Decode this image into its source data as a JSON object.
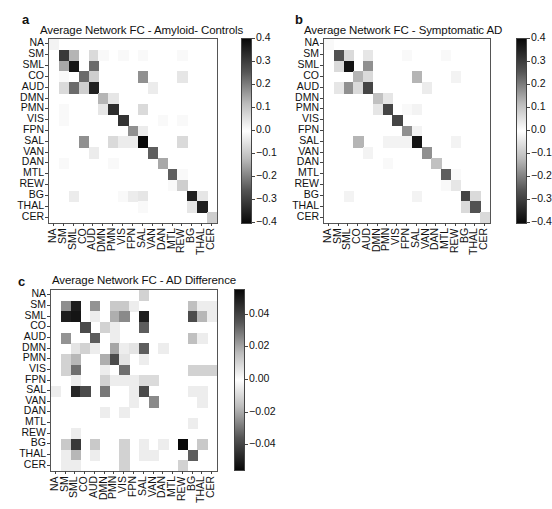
{
  "panels": [
    {
      "letter": "a",
      "title": "Average Network FC - Amyloid- Controls"
    },
    {
      "letter": "b",
      "title": "Average Network FC - Symptomatic AD"
    },
    {
      "letter": "c",
      "title": "Average Network FC - AD Difference"
    }
  ],
  "chart_data": [
    {
      "type": "heatmap",
      "title": "Average Network FC - Amyloid- Controls",
      "panel": "a",
      "rows": [
        "NA",
        "SM",
        "SML",
        "CO",
        "AUD",
        "DMN",
        "PMN",
        "VIS",
        "FPN",
        "SAL",
        "VAN",
        "DAN",
        "MTL",
        "REW",
        "BG",
        "THAL",
        "CER"
      ],
      "cols": [
        "NA",
        "SM",
        "SML",
        "CO",
        "AUD",
        "DMN",
        "PMN",
        "VIS",
        "FPN",
        "SAL",
        "VAN",
        "DAN",
        "MTL",
        "REW",
        "BG",
        "THAL",
        "CER"
      ],
      "colorbar": {
        "min": -0.4,
        "max": 0.4,
        "ticks": [
          "0.4",
          "0.3",
          "0.2",
          "0.1",
          "0.0",
          "−0.1",
          "−0.2",
          "−0.3",
          "−0.4"
        ],
        "colormap": "gray (black=|high|, white=0)"
      },
      "grid": false,
      "values": [
        [
          0.02,
          0,
          0,
          0,
          0,
          0,
          0,
          0,
          0,
          0,
          0,
          0,
          0,
          0,
          0,
          0,
          0
        ],
        [
          0,
          0.32,
          0.12,
          0,
          0.06,
          0.01,
          0,
          0.01,
          0,
          0.01,
          0,
          0,
          0,
          0.01,
          0,
          0,
          0
        ],
        [
          0,
          0.14,
          0.38,
          0,
          0.24,
          0,
          0,
          0,
          0,
          0,
          0,
          0,
          0,
          0,
          0,
          0,
          0
        ],
        [
          0,
          0.01,
          0,
          0.24,
          0.08,
          0,
          0,
          0,
          0,
          0.18,
          0,
          0,
          0,
          0.04,
          0,
          0,
          0
        ],
        [
          0,
          0.06,
          0.24,
          0.08,
          0.36,
          0,
          0,
          0,
          0,
          0,
          0.03,
          0,
          0,
          0,
          0,
          0,
          0
        ],
        [
          0,
          0,
          0,
          0,
          0,
          0.12,
          0.04,
          0,
          0,
          0,
          0,
          0,
          0,
          0,
          0,
          0,
          0
        ],
        [
          0,
          0.01,
          0,
          0,
          0,
          0.04,
          0.34,
          0,
          0,
          0.06,
          0,
          0,
          0,
          0,
          0,
          0,
          0
        ],
        [
          0,
          0.01,
          0,
          0,
          0,
          0,
          0,
          0.33,
          0,
          0,
          0,
          0.01,
          0,
          0.01,
          0,
          0,
          0
        ],
        [
          0,
          0,
          0,
          0,
          0,
          0,
          0,
          0,
          0.18,
          0.03,
          0,
          0,
          0,
          0,
          0,
          0,
          0
        ],
        [
          0,
          0,
          0,
          0.18,
          0,
          0,
          0.06,
          0.03,
          0.03,
          0.4,
          0,
          0,
          0,
          0.06,
          0,
          0,
          0
        ],
        [
          0,
          0,
          0,
          0,
          0.03,
          0,
          0,
          0,
          0,
          0,
          0.26,
          0,
          0,
          0,
          0,
          0,
          0
        ],
        [
          0,
          0.01,
          0,
          0,
          0,
          0,
          0.01,
          0,
          0,
          0,
          0,
          0.14,
          0,
          0,
          0,
          0,
          0
        ],
        [
          0,
          0,
          0,
          0,
          0,
          0,
          0,
          0,
          0,
          0,
          0,
          0,
          0.26,
          0.01,
          0,
          0,
          0
        ],
        [
          0,
          0,
          0,
          0,
          0,
          0,
          0,
          0,
          0,
          0,
          0,
          0,
          0.01,
          0.08,
          0,
          0,
          0
        ],
        [
          0,
          0,
          0.03,
          0,
          0,
          0,
          0,
          0.01,
          0.03,
          0.04,
          0,
          0,
          0,
          0,
          0.36,
          0.04,
          0
        ],
        [
          0,
          0,
          0,
          0,
          0,
          0,
          0,
          0,
          0,
          0.01,
          0,
          0,
          0,
          0,
          0.04,
          0.36,
          0
        ],
        [
          0,
          0,
          0,
          0,
          0,
          0,
          0,
          0,
          0,
          0,
          0,
          0,
          0,
          0,
          0,
          0,
          0.08
        ]
      ]
    },
    {
      "type": "heatmap",
      "title": "Average Network FC - Symptomatic AD",
      "panel": "b",
      "rows": [
        "NA",
        "SM",
        "SML",
        "CO",
        "AUD",
        "DMN",
        "PMN",
        "VIS",
        "FPN",
        "SAL",
        "VAN",
        "DAN",
        "MTL",
        "REW",
        "BG",
        "THAL",
        "CER"
      ],
      "cols": [
        "NA",
        "SM",
        "SML",
        "CO",
        "AUD",
        "DMN",
        "PMN",
        "VIS",
        "FPN",
        "SAL",
        "VAN",
        "DAN",
        "MTL",
        "REW",
        "BG",
        "THAL",
        "CER"
      ],
      "colorbar": {
        "min": -0.4,
        "max": 0.4,
        "ticks": [
          "0.4",
          "0.3",
          "0.2",
          "0.1",
          "0.0",
          "−0.1",
          "−0.2",
          "−0.3",
          "−0.4"
        ],
        "colormap": "gray (black=|high|, white=0)"
      },
      "grid": false,
      "values": [
        [
          0.01,
          0,
          0,
          0,
          0,
          0,
          0,
          0,
          0,
          0,
          0,
          0,
          0,
          0,
          0,
          0,
          0
        ],
        [
          0,
          0.28,
          0.06,
          0,
          0.04,
          0,
          0,
          0,
          0.01,
          0,
          0,
          0,
          0.01,
          0,
          0,
          0,
          0
        ],
        [
          0,
          0.06,
          0.38,
          0,
          0.18,
          0,
          0,
          0,
          0,
          0,
          0,
          0,
          0,
          0,
          0,
          0,
          0
        ],
        [
          0,
          0,
          0,
          0.12,
          0.06,
          0,
          0,
          0,
          0,
          0.12,
          0,
          0,
          0,
          0.02,
          0,
          0,
          0
        ],
        [
          0,
          0.04,
          0.18,
          0.06,
          0.3,
          0,
          0,
          0,
          0,
          0,
          0.03,
          0,
          0,
          0,
          0,
          0,
          0
        ],
        [
          0,
          0,
          0,
          0,
          0,
          0.1,
          0.04,
          0,
          0,
          0,
          0,
          0,
          0,
          0,
          0,
          0,
          0
        ],
        [
          0,
          0,
          0,
          0,
          0,
          0.04,
          0.3,
          0,
          0.01,
          0.02,
          0,
          0,
          0,
          0,
          0,
          0,
          0
        ],
        [
          0,
          0,
          0,
          0,
          0,
          0,
          0,
          0.3,
          0,
          0,
          0,
          0,
          0,
          0,
          0,
          0,
          0
        ],
        [
          0,
          0,
          0,
          0,
          0,
          0,
          0,
          0,
          0.18,
          0.02,
          0,
          0,
          0,
          0,
          0,
          0,
          0
        ],
        [
          0,
          0,
          0,
          0.12,
          0,
          0,
          0.02,
          0.02,
          0.02,
          0.38,
          0,
          0,
          0,
          0.02,
          0,
          0,
          0
        ],
        [
          0,
          0,
          0,
          0,
          0.02,
          0,
          0,
          0,
          0,
          0,
          0.18,
          0,
          0,
          0,
          0,
          0,
          0
        ],
        [
          0,
          0,
          0,
          0,
          0,
          0,
          0.01,
          0,
          0,
          0,
          0,
          0.1,
          0,
          0,
          0,
          0,
          0
        ],
        [
          0,
          0,
          0,
          0,
          0,
          0,
          0,
          0,
          0,
          0,
          0,
          0,
          0.26,
          0.01,
          0,
          0,
          0
        ],
        [
          0,
          0,
          0,
          0,
          0,
          0,
          0,
          0,
          0,
          0,
          0,
          0,
          0.01,
          0.04,
          0,
          0,
          0
        ],
        [
          0,
          0,
          0.02,
          0,
          0,
          0,
          0,
          0,
          0,
          0.02,
          0,
          0,
          0,
          0,
          0.3,
          0.06,
          0
        ],
        [
          0,
          0,
          0,
          0,
          0,
          0,
          0,
          0,
          0,
          0,
          0,
          0,
          0,
          0,
          0.06,
          0.28,
          0
        ],
        [
          0,
          0,
          0,
          0,
          0,
          0,
          0,
          0,
          0,
          0,
          0,
          0,
          0,
          0,
          0,
          0,
          0.06
        ]
      ]
    },
    {
      "type": "heatmap",
      "title": "Average Network FC - AD Difference",
      "panel": "c",
      "rows": [
        "NA",
        "SM",
        "SML",
        "CO",
        "AUD",
        "DMN",
        "PMN",
        "VIS",
        "FPN",
        "SAL",
        "VAN",
        "DAN",
        "MTL",
        "REW",
        "BG",
        "THAL",
        "CER"
      ],
      "cols": [
        "NA",
        "SM",
        "SML",
        "CO",
        "AUD",
        "DMN",
        "PMN",
        "VIS",
        "FPN",
        "SAL",
        "VAN",
        "DAN",
        "MTL",
        "REW",
        "BG",
        "THAL",
        "CER"
      ],
      "colorbar": {
        "min": -0.055,
        "max": 0.055,
        "ticks": [
          "0.04",
          "0.02",
          "0.00",
          "−0.02",
          "−0.04"
        ],
        "colormap": "gray (black=|high|, white=0)"
      },
      "grid": false,
      "values": [
        [
          0,
          0,
          0,
          0,
          0,
          0,
          0,
          0,
          0,
          0.01,
          0,
          0,
          0,
          0,
          0,
          0,
          0
        ],
        [
          0,
          0.025,
          0.05,
          0,
          0.024,
          0,
          0.012,
          0.012,
          0.004,
          0,
          0,
          0,
          0,
          0,
          0.014,
          0.004,
          0.004
        ],
        [
          0,
          0.05,
          0.052,
          0,
          0.004,
          0,
          0.018,
          0.026,
          0,
          0.05,
          0,
          0,
          0,
          0,
          0.04,
          0.016,
          0.004
        ],
        [
          0,
          0,
          0,
          0.04,
          0,
          0.01,
          0.004,
          0,
          0,
          0.036,
          0,
          0,
          0,
          0,
          0,
          0,
          0
        ],
        [
          0,
          0.024,
          0,
          0,
          0.036,
          0,
          0.004,
          0,
          0,
          0,
          0,
          0,
          0,
          0,
          0.014,
          0.004,
          0
        ],
        [
          0,
          0,
          0.006,
          0.01,
          0.004,
          0,
          0.02,
          0.004,
          0.006,
          0.036,
          0,
          0.004,
          0,
          0,
          0,
          0,
          0
        ],
        [
          0,
          0.01,
          0.016,
          0,
          0,
          0.018,
          0.04,
          0.006,
          0,
          0.004,
          0,
          0,
          0,
          0,
          0,
          0,
          0
        ],
        [
          0,
          0.01,
          0.032,
          0,
          0,
          0.004,
          0,
          0.032,
          0,
          0,
          0,
          0,
          0,
          0,
          0.01,
          0.01,
          0.01
        ],
        [
          0,
          0,
          0.004,
          0,
          0,
          0.01,
          0.004,
          0.004,
          0.004,
          0.008,
          0.008,
          0,
          0,
          0,
          0,
          0,
          0
        ],
        [
          0.004,
          0,
          0.048,
          0.04,
          0,
          0.03,
          0,
          0,
          0.004,
          0.04,
          0,
          0,
          0,
          0,
          0.004,
          0.004,
          0
        ],
        [
          0,
          0,
          0,
          0,
          0,
          0,
          0,
          0,
          0.004,
          0,
          0.026,
          0,
          0,
          0,
          0,
          0.004,
          0
        ],
        [
          0,
          0,
          0,
          0,
          0,
          0.004,
          0,
          0.004,
          0,
          0,
          0,
          0,
          0,
          0,
          0,
          0,
          0
        ],
        [
          0,
          0,
          0,
          0,
          0,
          0,
          0,
          0,
          0,
          0,
          0,
          0,
          0,
          0,
          0.004,
          0,
          0
        ],
        [
          0,
          0,
          0.004,
          0,
          0,
          0,
          0,
          0,
          0,
          0,
          0,
          0,
          0,
          0,
          0,
          0,
          0
        ],
        [
          0,
          0.012,
          0.044,
          0,
          0.012,
          0,
          0,
          0.01,
          0,
          0.004,
          0,
          0.004,
          0,
          0.055,
          0,
          0.012,
          0
        ],
        [
          0,
          0.004,
          0.016,
          0,
          0.004,
          0,
          0,
          0.01,
          0,
          0.004,
          0.004,
          0,
          0,
          0,
          0.036,
          0,
          0
        ],
        [
          0,
          0.004,
          0.004,
          0,
          0,
          0,
          0,
          0.01,
          0,
          0,
          0,
          0,
          0,
          0.01,
          0,
          0,
          0
        ]
      ]
    }
  ]
}
